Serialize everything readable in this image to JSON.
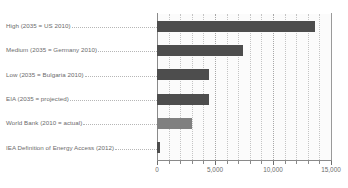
{
  "chart_data": {
    "type": "bar",
    "orientation": "horizontal",
    "title": "",
    "xlabel": "",
    "ylabel": "",
    "categories": [
      "High (2035 = US 2010)",
      "Medium (2035 = Germany 2010)",
      "Low (2035 = Bulgaria 2010)",
      "EIA (2035 = projected)",
      "World Bank (2010 = actual)",
      "IEA Definition of Energy Access (2012)"
    ],
    "values": [
      13600,
      7400,
      4500,
      4500,
      3000,
      250
    ],
    "bar_colors": [
      "#4d4d4d",
      "#4d4d4d",
      "#4d4d4d",
      "#4d4d4d",
      "#808080",
      "#4d4d4d"
    ],
    "xlim": [
      0,
      15000
    ],
    "xticks": [
      0,
      5000,
      10000,
      15000
    ],
    "xtick_labels": [
      "0",
      "5,000",
      "10,000",
      "15,000"
    ],
    "minor_tick_step": 1000,
    "grid": true,
    "grid_axis": "x",
    "legend": null
  },
  "axis": {
    "tick_labels": [
      "0",
      "5,000",
      "10,000",
      "15,000"
    ]
  },
  "colors": {
    "bar_dark": "#4d4d4d",
    "bar_light": "#808080",
    "text": "#6b6b6b",
    "grid": "#c4c4c4",
    "axis": "#8a8a8a",
    "plot_background": "#fbfbfb",
    "page_background": "#ffffff"
  }
}
